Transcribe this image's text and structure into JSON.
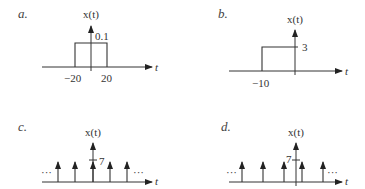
{
  "panels": {
    "a": {
      "label": "a.",
      "ylabel": "x(t)",
      "xlabel": "t",
      "amplitude_label": "0.1",
      "ticks": [
        "−20",
        "20"
      ]
    },
    "b": {
      "label": "b.",
      "ylabel": "x(t)",
      "xlabel": "t",
      "amplitude_label": "3",
      "ticks": [
        "−10"
      ]
    },
    "c": {
      "label": "c.",
      "ylabel": "x(t)",
      "xlabel": "t",
      "amplitude_label": "7",
      "ellipsis_left": "···",
      "ellipsis_right": "···"
    },
    "d": {
      "label": "d.",
      "ylabel": "x(t)",
      "xlabel": "t",
      "amplitude_label": "7",
      "ellipsis_left": "···",
      "ellipsis_right": "···"
    }
  }
}
